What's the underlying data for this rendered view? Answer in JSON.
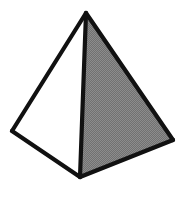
{
  "figure": {
    "title": "Square pyramid line drawing",
    "object_name": "pyramid",
    "canvas": {
      "width": 188,
      "height": 207,
      "background_color": "#ffffff"
    },
    "style": {
      "edge_color": "#111111",
      "edge_width": 4.2,
      "shaded_face_color": "#7f7f7f",
      "shaded_face_dither": "50% halftone checker",
      "lit_face_color": "#ffffff",
      "dither_light": "#8e8e8e",
      "dither_dark": "#6e6e6e"
    },
    "vertices": {
      "apex": {
        "label": "apex",
        "x": 86,
        "y": 13
      },
      "left": {
        "label": "left-base-corner",
        "x": 12,
        "y": 131
      },
      "front": {
        "label": "front-base-corner",
        "x": 80,
        "y": 177
      },
      "right": {
        "label": "right-base-corner",
        "x": 173,
        "y": 140
      }
    },
    "faces": [
      {
        "name": "left-face",
        "fill": "#ffffff",
        "shading": "lit",
        "points": "86,13 12,131 80,177"
      },
      {
        "name": "right-face",
        "fill": "#7f7f7f",
        "shading": "shaded",
        "points": "86,13 80,177 173,140"
      }
    ],
    "edges": [
      {
        "name": "apex-to-left-edge",
        "x1": 86,
        "y1": 13,
        "x2": 12,
        "y2": 131
      },
      {
        "name": "apex-to-front-edge",
        "x1": 86,
        "y1": 13,
        "x2": 80,
        "y2": 177
      },
      {
        "name": "apex-to-right-edge",
        "x1": 86,
        "y1": 13,
        "x2": 173,
        "y2": 140
      },
      {
        "name": "left-to-front-base-edge",
        "x1": 12,
        "y1": 131,
        "x2": 80,
        "y2": 177
      },
      {
        "name": "front-to-right-base-edge",
        "x1": 80,
        "y1": 177,
        "x2": 173,
        "y2": 140
      }
    ]
  }
}
